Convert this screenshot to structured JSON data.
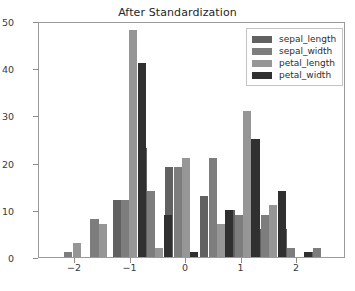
{
  "chart_data": {
    "type": "bar",
    "title": "After Standardization",
    "xlabel": "",
    "ylabel": "",
    "xlim": [
      -2.65,
      2.88
    ],
    "ylim": [
      0,
      50
    ],
    "grid": false,
    "legend_position": "upper right",
    "xticks": [
      -2,
      -1,
      0,
      1,
      2
    ],
    "xticklabels": [
      "−2",
      "−1",
      "0",
      "1",
      "2"
    ],
    "yticks": [
      0,
      10,
      20,
      30,
      40,
      50
    ],
    "yticklabels": [
      "0",
      "10",
      "20",
      "30",
      "40",
      "50"
    ],
    "bar_width": 0.145,
    "series": [
      {
        "name": "sepal_length",
        "color": "#616161",
        "bars": [
          {
            "x": -1.25,
            "value": 12
          },
          {
            "x": -0.78,
            "value": 23
          },
          {
            "x": -0.3,
            "value": 19
          },
          {
            "x": 0.33,
            "value": 13
          },
          {
            "x": 0.8,
            "value": 10
          },
          {
            "x": 1.27,
            "value": 6
          },
          {
            "x": 1.74,
            "value": 6
          },
          {
            "x": 2.21,
            "value": 1
          }
        ]
      },
      {
        "name": "sepal_width",
        "color": "#7d7d7d",
        "bars": [
          {
            "x": -2.12,
            "value": 1
          },
          {
            "x": -1.65,
            "value": 8
          },
          {
            "x": -1.1,
            "value": 12
          },
          {
            "x": -0.63,
            "value": 14
          },
          {
            "x": -0.15,
            "value": 19
          },
          {
            "x": 0.48,
            "value": 21
          },
          {
            "x": 0.95,
            "value": 9
          },
          {
            "x": 1.42,
            "value": 9
          },
          {
            "x": 1.89,
            "value": 2
          },
          {
            "x": 2.36,
            "value": 2
          }
        ]
      },
      {
        "name": "petal_length",
        "color": "#969696",
        "bars": [
          {
            "x": -1.97,
            "value": 3
          },
          {
            "x": -1.5,
            "value": 7
          },
          {
            "x": -0.95,
            "value": 48
          },
          {
            "x": -0.48,
            "value": 2
          },
          {
            "x": 0.0,
            "value": 21
          },
          {
            "x": 0.63,
            "value": 7
          },
          {
            "x": 1.1,
            "value": 31
          },
          {
            "x": 1.57,
            "value": 11
          }
        ]
      },
      {
        "name": "petal_width",
        "color": "#303030",
        "bars": [
          {
            "x": -0.8,
            "value": 41
          },
          {
            "x": -0.33,
            "value": 9
          },
          {
            "x": 0.15,
            "value": 1
          },
          {
            "x": 0.78,
            "value": 10
          },
          {
            "x": 1.25,
            "value": 25
          },
          {
            "x": 1.72,
            "value": 14
          },
          {
            "x": 2.19,
            "value": 1
          }
        ]
      }
    ]
  },
  "legend": {
    "items": [
      {
        "label": "sepal_length",
        "color": "#616161"
      },
      {
        "label": "sepal_width",
        "color": "#7d7d7d"
      },
      {
        "label": "petal_length",
        "color": "#969696"
      },
      {
        "label": "petal_width",
        "color": "#303030"
      }
    ]
  }
}
